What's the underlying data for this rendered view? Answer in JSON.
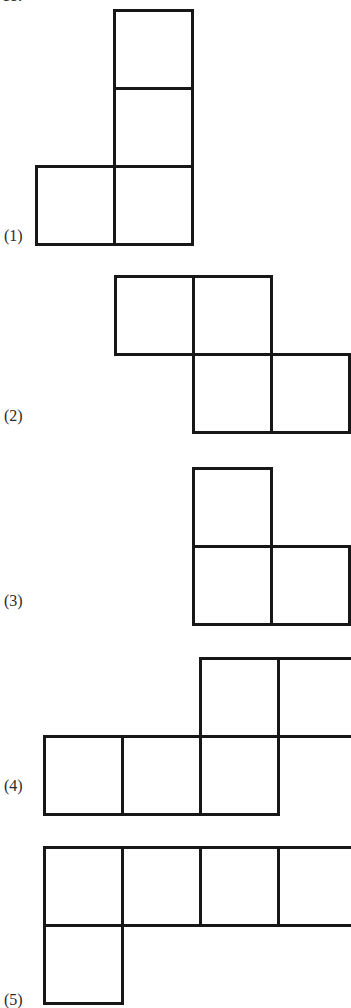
{
  "page": {
    "background_color": "#ffffff",
    "ink_color": "#171717",
    "width": 351,
    "height": 1003,
    "cut_off_text_top": "ce:"
  },
  "figure": {
    "kind": "net-of-a-cube-options",
    "cell_size": 78,
    "stroke_width": 3,
    "shapes": [
      {
        "label": "(1)",
        "label_x": 4,
        "label_y": 228,
        "origin_x": 36,
        "origin_y": 10,
        "cells": [
          {
            "col": 1,
            "row": 0
          },
          {
            "col": 1,
            "row": 1
          },
          {
            "col": 0,
            "row": 2
          },
          {
            "col": 1,
            "row": 2
          }
        ]
      },
      {
        "label": "(2)",
        "label_x": 4,
        "label_y": 408,
        "origin_x": 115,
        "origin_y": 276,
        "cells": [
          {
            "col": 0,
            "row": 0
          },
          {
            "col": 1,
            "row": 0
          },
          {
            "col": 1,
            "row": 1
          },
          {
            "col": 2,
            "row": 1
          }
        ]
      },
      {
        "label": "(3)",
        "label_x": 4,
        "label_y": 593,
        "origin_x": 193,
        "origin_y": 468,
        "cells": [
          {
            "col": 0,
            "row": 0
          },
          {
            "col": 0,
            "row": 1
          },
          {
            "col": 1,
            "row": 1
          }
        ]
      },
      {
        "label": "(4)",
        "label_x": 4,
        "label_y": 778,
        "origin_x": 44,
        "origin_y": 658,
        "cells": [
          {
            "col": 2,
            "row": 0
          },
          {
            "col": 3,
            "row": 0
          },
          {
            "col": 0,
            "row": 1
          },
          {
            "col": 1,
            "row": 1
          },
          {
            "col": 2,
            "row": 1
          }
        ]
      },
      {
        "label": "(5)",
        "label_x": 4,
        "label_y": 992,
        "origin_x": 44,
        "origin_y": 847,
        "cells": [
          {
            "col": 0,
            "row": 0
          },
          {
            "col": 1,
            "row": 0
          },
          {
            "col": 2,
            "row": 0
          },
          {
            "col": 3,
            "row": 0
          },
          {
            "col": 0,
            "row": 1
          }
        ]
      }
    ]
  }
}
